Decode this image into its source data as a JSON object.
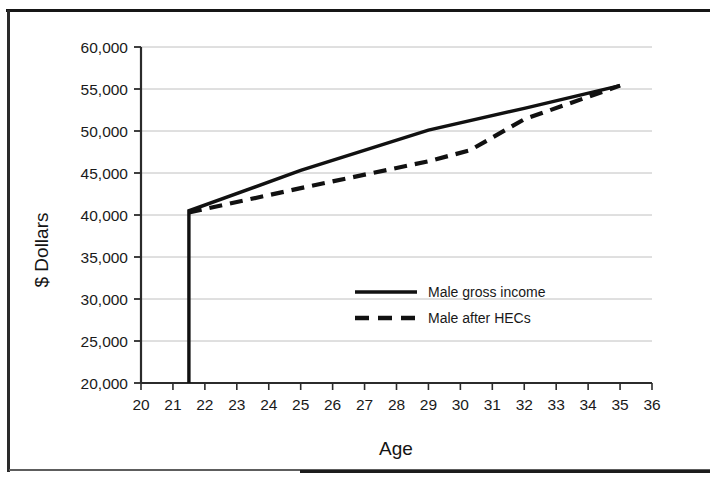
{
  "chart_data": {
    "type": "line",
    "title": "",
    "xlabel": "Age",
    "ylabel": "$ Dollars",
    "xlim": [
      20,
      36
    ],
    "ylim": [
      20000,
      60000
    ],
    "xticks": [
      20,
      21,
      22,
      23,
      24,
      25,
      26,
      27,
      28,
      29,
      30,
      31,
      32,
      33,
      34,
      35,
      36
    ],
    "xtick_labels": [
      "20",
      "21",
      "22",
      "23",
      "24",
      "25",
      "26",
      "27",
      "28",
      "29",
      "30",
      "31",
      "32",
      "33",
      "34",
      "35",
      "36"
    ],
    "yticks": [
      20000,
      25000,
      30000,
      35000,
      40000,
      45000,
      50000,
      55000,
      60000
    ],
    "ytick_labels": [
      "20,000",
      "25,000",
      "30,000",
      "35,000",
      "40,000",
      "45,000",
      "50,000",
      "55,000",
      "60,000"
    ],
    "grid": true,
    "grid_axis": "y",
    "legend_position": "center",
    "line_color": "#111111",
    "grid_color": "#b9b9b9",
    "series": [
      {
        "name": "Male gross income",
        "style": "solid",
        "x": [
          21.5,
          21.5,
          25.0,
          29.0,
          32.0,
          35.0
        ],
        "values": [
          20000,
          40500,
          45300,
          50100,
          52700,
          55400
        ]
      },
      {
        "name": "Male after HECs",
        "style": "dashed",
        "x": [
          21.5,
          25.0,
          29.0,
          30.3,
          32.0,
          35.0
        ],
        "values": [
          40300,
          43200,
          46400,
          47700,
          51400,
          55400
        ]
      }
    ]
  },
  "legend": {
    "entries": [
      {
        "label": "Male gross income",
        "style": "solid"
      },
      {
        "label": "Male after HECs",
        "style": "dashed"
      }
    ]
  }
}
